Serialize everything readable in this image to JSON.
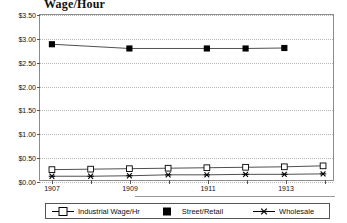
{
  "chart_data": {
    "type": "line",
    "title": "Wage/Hour",
    "xlabel": "",
    "ylabel": "",
    "ylim": [
      0,
      3.5
    ],
    "ytick_values": [
      0,
      0.5,
      1.0,
      1.5,
      2.0,
      2.5,
      3.0,
      3.5
    ],
    "ytick_labels": [
      "$0.00",
      "$0.50",
      "$1.00",
      "$1.50",
      "$2.00",
      "$2.50",
      "$3.00",
      "$3.50"
    ],
    "x": [
      1907,
      1908,
      1909,
      1910,
      1911,
      1912,
      1913,
      1914
    ],
    "xtick_labels": [
      "1907",
      "",
      "1909",
      "",
      "1911",
      "",
      "1913",
      ""
    ],
    "xtick_labeled": [
      "1907",
      "1909",
      "1911",
      "1913"
    ],
    "grid": true,
    "legend_position": "bottom",
    "series": [
      {
        "name": "Industrial Wage/Hr",
        "marker": "open-square",
        "color": "#000000",
        "x": [
          1907,
          1908,
          1909,
          1910,
          1911,
          1912,
          1913,
          1914
        ],
        "values": [
          0.22,
          0.23,
          0.24,
          0.25,
          0.26,
          0.27,
          0.28,
          0.3
        ]
      },
      {
        "name": "Street/Retail",
        "marker": "filled-square",
        "color": "#000000",
        "x": [
          1907,
          1909,
          1911,
          1912,
          1913
        ],
        "values": [
          2.88,
          2.79,
          2.79,
          2.79,
          2.8
        ]
      },
      {
        "name": "Wholesale",
        "marker": "asterisk",
        "color": "#000000",
        "x": [
          1907,
          1908,
          1909,
          1910,
          1911,
          1912,
          1913,
          1914
        ],
        "values": [
          0.08,
          0.08,
          0.09,
          0.11,
          0.11,
          0.12,
          0.12,
          0.13
        ]
      }
    ]
  },
  "legend": {
    "items": [
      {
        "label": "Industrial Wage/Hr",
        "marker": "open-square"
      },
      {
        "label": "Street/Retail",
        "marker": "filled-square"
      },
      {
        "label": "Wholesale",
        "marker": "asterisk"
      }
    ]
  }
}
